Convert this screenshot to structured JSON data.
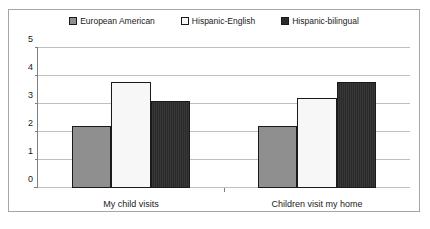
{
  "chart_data": {
    "type": "bar",
    "title": "",
    "xlabel": "",
    "ylabel": "",
    "ylim": [
      0,
      5
    ],
    "yticks": [
      0,
      1,
      2,
      3,
      4,
      5
    ],
    "grid": true,
    "legend_position": "top-center",
    "categories": [
      "My child visits",
      "Children visit my home"
    ],
    "series": [
      {
        "name": "European American",
        "swatch": "#8f8f8f",
        "values": [
          2.2,
          2.2
        ]
      },
      {
        "name": "Hispanic-English",
        "swatch": "#f7f7f7",
        "values": [
          3.8,
          3.2
        ]
      },
      {
        "name": "Hispanic-bilingual",
        "swatch": "#2b2b2b",
        "values": [
          3.1,
          3.8
        ]
      }
    ]
  }
}
